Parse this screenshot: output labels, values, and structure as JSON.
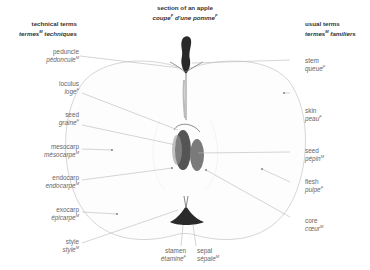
{
  "headers": {
    "left": {
      "en": "technical terms",
      "fr": "termes",
      "fr_gender": "M",
      "fr_rest": " techniques"
    },
    "center": {
      "en": "section of an apple",
      "fr1": "coupe",
      "fr1_gender": "F",
      "fr2": " d'une pomme",
      "fr2_gender": "F"
    },
    "right": {
      "en": "usual terms",
      "fr": "termes",
      "fr_gender": "M",
      "fr_rest": " familiers"
    }
  },
  "labels": {
    "left": [
      {
        "en": "peduncle",
        "fr": "pédoncule",
        "gender": "M"
      },
      {
        "en": "loculus",
        "fr": "loge",
        "gender": "F"
      },
      {
        "en": "seed",
        "fr": "graine",
        "gender": "F"
      },
      {
        "en": "mesocarp",
        "fr": "mésocarpe",
        "gender": "M"
      },
      {
        "en": "endocarp",
        "fr": "endocarpe",
        "gender": "M"
      },
      {
        "en": "exocarp",
        "fr": "épicarpe",
        "gender": "M"
      },
      {
        "en": "style",
        "fr": "style",
        "gender": "M"
      }
    ],
    "right": [
      {
        "en": "stem",
        "fr": "queue",
        "gender": "F"
      },
      {
        "en": "skin",
        "fr": "peau",
        "gender": "F"
      },
      {
        "en": "seed",
        "fr": "pépin",
        "gender": "M"
      },
      {
        "en": "flesh",
        "fr": "pulpe",
        "gender": "F"
      },
      {
        "en": "core",
        "fr": "cœur",
        "gender": "M"
      }
    ],
    "bottom": [
      {
        "en": "stamen",
        "fr": "étamine",
        "gender": "F"
      },
      {
        "en": "sepal",
        "fr": "sépale",
        "gender": "M"
      }
    ]
  },
  "colors": {
    "outline": "#c8c8c8",
    "leader": "#b8b8b8",
    "dark": "#2a2a2a",
    "core": "#555555"
  }
}
